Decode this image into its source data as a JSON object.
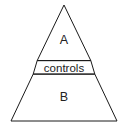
{
  "diagram": {
    "type": "pyramid",
    "shape_name": "triangle",
    "background_color": "#ffffff",
    "line_color": "#1a1a1a",
    "text_color": "#222222",
    "geometry": {
      "apex": {
        "x": 64,
        "y": 5
      },
      "base_left": {
        "x": 11,
        "y": 121
      },
      "base_right": {
        "x": 117,
        "y": 121
      },
      "band_top_y": 60,
      "band_bottom_y": 74
    },
    "segments": [
      {
        "id": "top",
        "label": "A",
        "label_x": 64,
        "label_y": 40
      },
      {
        "id": "middle",
        "label": "controls",
        "label_x": 64,
        "label_y": 67
      },
      {
        "id": "bottom",
        "label": "B",
        "label_x": 64,
        "label_y": 97
      }
    ]
  }
}
